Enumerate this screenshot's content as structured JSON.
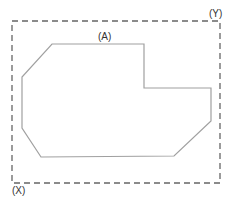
{
  "diagram": {
    "labels": {
      "boundary_corner": "(Y)",
      "origin_corner": "(X)",
      "shape": "(A)"
    },
    "boundary": {
      "style": "dashed",
      "color": "#666666",
      "x": 12,
      "y": 21,
      "width": 208,
      "height": 162
    },
    "shape": {
      "color": "#a0a0a0",
      "points": [
        [
          52,
          44
        ],
        [
          144,
          44
        ],
        [
          144,
          88
        ],
        [
          211,
          88
        ],
        [
          211,
          121
        ],
        [
          174,
          156
        ],
        [
          41,
          157
        ],
        [
          22,
          128
        ],
        [
          22,
          77
        ]
      ]
    }
  }
}
